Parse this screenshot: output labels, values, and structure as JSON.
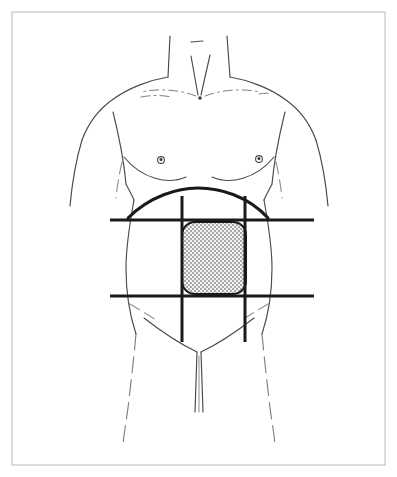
{
  "figure": {
    "style": "black line drawing on white background",
    "canvas": {
      "width": 397,
      "height": 477
    },
    "colors": {
      "background": "#ffffff",
      "outline": "#4a4a4a",
      "grid_line": "#1a1a1a",
      "frame": "#b9b9b9",
      "shaded_fill": "#e8e8e8",
      "stipple_dot": "#3a3a3a"
    }
  },
  "frame": {
    "name": "figure-border",
    "x": 12,
    "y": 12,
    "width": 373,
    "height": 453,
    "stroke_width": 1
  },
  "body": {
    "neck": {
      "left_edge": "M 170 36 L 168 77",
      "right_edge": "M 227 36 L 230 77",
      "chin_shadow": "M 191 42 L 203 41",
      "throat_left": "M 191 56 L 198 95",
      "throat_right": "M 210 55 L 201 95",
      "sternal_notch": {
        "cx": 200,
        "cy": 98,
        "r": 1.8
      }
    },
    "shoulders": {
      "left": "M 168 77 C 150 80 128 88 112 100 C 98 110 88 124 82 140",
      "right": "M 230 77 C 248 80 270 88 286 100 C 300 110 310 124 316 140"
    },
    "clavicles": {
      "left": "M 196 96 C 180 90 160 88 141 92",
      "right": "M 205 96 C 221 90 241 88 260 92",
      "left_accent": "M 141 97 C 152 95 162 95 171 97",
      "right_accent": "M 259 94 C 264 93 268 93 271 94"
    },
    "arms": {
      "left_outer": "M 82 140 C 76 160 72 184 70 206",
      "right_outer": "M 316 140 C 322 160 326 184 328 206",
      "left_inner": "M 113 112 C 119 136 124 162 126 184",
      "right_inner": "M 285 112 C 279 136 274 162 272 184",
      "left_armpit_crease": "M 126 184 C 129 190 132 195 134 200",
      "right_armpit_crease": "M 272 184 C 269 190 266 195 264 200",
      "left_arm_hint": "M 122 162 C 119 175 117 188 116 198",
      "right_arm_hint": "M 276 162 C 279 175 281 188 282 198"
    },
    "pectorals": {
      "left_lower": "M 124 157 C 142 179 168 185 186 177",
      "right_lower": "M 274 157 C 256 179 230 185 212 177",
      "left_edge": "M 124 157 C 122 150 122 144 123 139",
      "right_edge": "M 274 157 C 276 150 276 144 275 139"
    },
    "nipples": [
      {
        "name": "nipple-left",
        "cx": 161,
        "cy": 160,
        "r_outer": 3.4,
        "r_inner": 1.5
      },
      {
        "name": "nipple-right",
        "cx": 259,
        "cy": 159,
        "r_outer": 3.4,
        "r_inner": 1.5
      }
    ],
    "torso_sides": {
      "left_waist": "M 134 200 C 130 222 126 248 126 268 C 126 292 130 316 136 334",
      "right_waist": "M 264 200 C 268 222 272 248 272 268 C 272 292 268 316 262 334",
      "left_hip": "M 136 334 C 134 356 131 382 128 408 C 126 422 124 434 123 444",
      "right_hip": "M 262 334 C 264 356 267 382 270 408 C 272 422 274 434 275 444"
    },
    "inguinal": {
      "left_crease": "M 144 318 C 162 332 180 344 197 352",
      "right_crease": "M 254 318 C 236 332 218 344 201 352",
      "left_fold_hint": "M 130 304 C 140 310 150 316 158 321",
      "right_fold_hint": "M 268 304 C 258 310 248 316 240 321",
      "genital_left": "M 197 352 L 195 412",
      "genital_right": "M 201 352 L 203 412",
      "genital_center": "M 199 356 L 199 412"
    }
  },
  "grid": {
    "description": "Nine-region (Addison) planes overlaid on the abdomen",
    "stroke_width": 3,
    "horizontal_lines": [
      {
        "name": "subcostal-plane",
        "label": "subcostal / transpyloric plane",
        "x1": 110,
        "x2": 314,
        "y": 220
      },
      {
        "name": "transtubercular-plane",
        "label": "transtubercular plane",
        "x1": 110,
        "x2": 314,
        "y": 296
      }
    ],
    "vertical_lines": [
      {
        "name": "left-midclavicular-line",
        "label": "left midclavicular line",
        "x": 182,
        "y1": 196,
        "y2": 342
      },
      {
        "name": "right-midclavicular-line",
        "label": "right midclavicular line",
        "x": 245,
        "y1": 196,
        "y2": 342
      }
    ]
  },
  "costal_arch": {
    "name": "costal-margin",
    "label": "costal margin",
    "path": "M 128 218 C 150 196 178 188 198 188 C 220 188 248 196 268 218",
    "stroke_width": 3
  },
  "shaded_region": {
    "name": "epigastric-region",
    "label": "epigastric region",
    "x": 182,
    "y": 222,
    "width": 64,
    "height": 72,
    "corner_radius": 13,
    "fill_pattern": "stipple-dots",
    "stroke_width": 2
  }
}
